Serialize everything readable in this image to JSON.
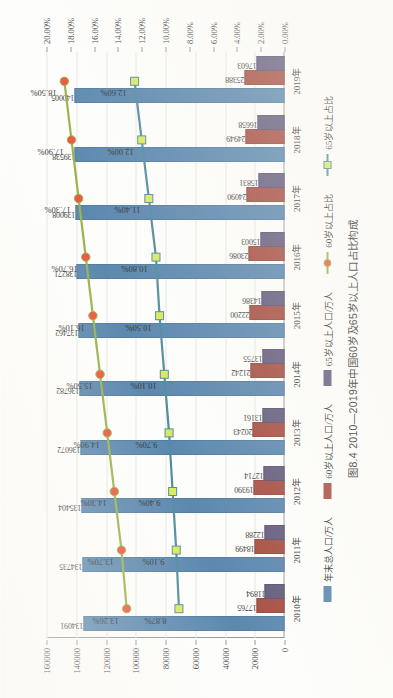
{
  "caption": "图8.4  2010—2019年中国60岁及65岁以上人口占比构成",
  "colors": {
    "total_bar": "#4a7ba6",
    "elderly60_bar": "#9d3b2e",
    "elderly65_bar": "#554a70",
    "line60": "#8faa36",
    "marker60": "#e8462a",
    "line65": "#3f7f96",
    "marker65": "#d7e84a"
  },
  "legend": {
    "position": "bottom",
    "items": [
      {
        "label": "年末总人口/万人",
        "type": "bar",
        "color": "#4a7ba6"
      },
      {
        "label": "60岁以上人口/万人",
        "type": "bar",
        "color": "#9d3b2e"
      },
      {
        "label": "65岁以上人口/万人",
        "type": "bar",
        "color": "#554a70"
      },
      {
        "label": "60岁以上占比",
        "type": "line-circle",
        "color": "#8faa36",
        "marker": "#e8462a"
      },
      {
        "label": "65岁以上占比",
        "type": "line-square",
        "color": "#3f7f96",
        "marker": "#d7e84a"
      }
    ]
  },
  "axes": {
    "primary_ticks": [
      "0",
      "20000",
      "40000",
      "60000",
      "80000",
      "100000",
      "120000",
      "140000",
      "160000"
    ],
    "secondary_ticks": [
      "0.00%",
      "2.00%",
      "4.00%",
      "6.00%",
      "8.00%",
      "10.00%",
      "12.00%",
      "14.00%",
      "16.00%",
      "18.00%",
      "20.00%"
    ],
    "categories": [
      "2010年",
      "2011年",
      "2012年",
      "2013年",
      "2014年",
      "2015年",
      "2016年",
      "2017年",
      "2018年",
      "2019年"
    ]
  },
  "chart_data": {
    "type": "bar",
    "title": "图8.4  2010—2019年中国60岁及65岁以上人口占比构成",
    "xlabel": "",
    "ylabel": "",
    "grid": true,
    "categories": [
      "2010年",
      "2011年",
      "2012年",
      "2013年",
      "2014年",
      "2015年",
      "2016年",
      "2017年",
      "2018年",
      "2019年"
    ],
    "ylim": [
      0,
      160000
    ],
    "y2lim": [
      0,
      0.2
    ],
    "y2_tick_step": 0.02,
    "y_tick_step": 20000,
    "series": [
      {
        "name": "年末总人口/万人",
        "type": "bar",
        "axis": "primary",
        "color": "#4a7ba6",
        "values": [
          134091,
          134735,
          135404,
          136072,
          136782,
          137462,
          138271,
          139008,
          139538,
          140005
        ],
        "labels": [
          "134091",
          "134735",
          "135404",
          "136072",
          "136782",
          "137462",
          "138271",
          "139008",
          "139538",
          "140005"
        ]
      },
      {
        "name": "60岁以上人口/万人",
        "type": "bar",
        "axis": "primary",
        "color": "#9d3b2e",
        "values": [
          17765,
          18499,
          19390,
          20243,
          21242,
          22200,
          23086,
          24090,
          24949,
          25388
        ],
        "labels": [
          "17765",
          "18499",
          "19390",
          "20243",
          "21242",
          "22200",
          "23086",
          "24090",
          "24949",
          "25388"
        ]
      },
      {
        "name": "65岁以上人口/万人",
        "type": "bar",
        "axis": "primary",
        "color": "#554a70",
        "values": [
          11894,
          12288,
          12714,
          13161,
          13755,
          14386,
          15003,
          15831,
          16658,
          17603
        ],
        "labels": [
          "11894",
          "12288",
          "12714",
          "13161",
          "13755",
          "14386",
          "15003",
          "15831",
          "16658",
          "17603"
        ]
      },
      {
        "name": "60岁以上占比",
        "type": "line",
        "axis": "secondary",
        "color": "#8faa36",
        "marker": "circle",
        "marker_color": "#e8462a",
        "values": [
          0.1326,
          0.137,
          0.143,
          0.149,
          0.155,
          0.161,
          0.167,
          0.173,
          0.179,
          0.185
        ],
        "labels": [
          "13.26%",
          "13.70%",
          "14.30%",
          "14.90%",
          "15.50%",
          "16.10%",
          "16.70%",
          "17.30%",
          "17.90%",
          "18.50%"
        ]
      },
      {
        "name": "65岁以上占比",
        "type": "line",
        "axis": "secondary",
        "color": "#3f7f96",
        "marker": "square",
        "marker_color": "#d7e84a",
        "values": [
          0.0887,
          0.091,
          0.094,
          0.097,
          0.101,
          0.105,
          0.108,
          0.114,
          0.12,
          0.126
        ],
        "labels": [
          "8.87%",
          "9.10%",
          "9.40%",
          "9.70%",
          "10.10%",
          "10.50%",
          "10.80%",
          "11.40%",
          "12.00%",
          "12.60%"
        ]
      }
    ]
  }
}
